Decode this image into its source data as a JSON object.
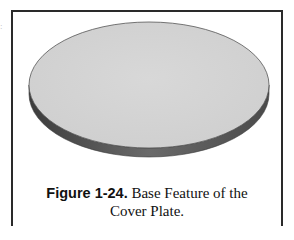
{
  "edge_fragment": ":",
  "figure": {
    "image_description": "Base feature of the cover plate (flat circular disc)",
    "colors": {
      "top_face": "#d4d4d4",
      "side_face": "#5a5a5a",
      "outline": "#4a4a4a",
      "frame": "#2a2a2a"
    },
    "caption": {
      "label": "Figure 1-24.",
      "text_line1": " Base Feature of the",
      "text_line2": "Cover Plate."
    }
  }
}
